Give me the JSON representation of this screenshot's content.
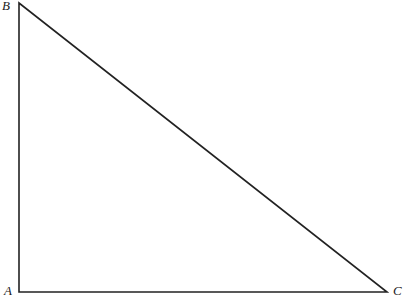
{
  "diagram": {
    "type": "right-triangle",
    "vertices": [
      {
        "label": "A",
        "x": 19,
        "y": 292
      },
      {
        "label": "B",
        "x": 19,
        "y": 3
      },
      {
        "label": "C",
        "x": 387,
        "y": 292
      }
    ],
    "right_angle_at": "A",
    "stroke_color": "#222222"
  }
}
